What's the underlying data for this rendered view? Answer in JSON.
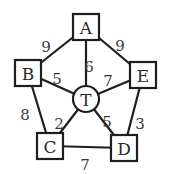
{
  "diagram": {
    "type": "weighted-graph",
    "nodes": [
      {
        "id": "A",
        "label": "A",
        "shape": "square",
        "cx": 86,
        "cy": 27
      },
      {
        "id": "B",
        "label": "B",
        "shape": "square",
        "cx": 28,
        "cy": 73
      },
      {
        "id": "E",
        "label": "E",
        "shape": "square",
        "cx": 143,
        "cy": 75
      },
      {
        "id": "C",
        "label": "C",
        "shape": "square",
        "cx": 50,
        "cy": 146
      },
      {
        "id": "D",
        "label": "D",
        "shape": "square",
        "cx": 124,
        "cy": 148
      },
      {
        "id": "T",
        "label": "T",
        "shape": "circle",
        "cx": 86,
        "cy": 99
      }
    ],
    "edges": [
      {
        "from": "A",
        "to": "B",
        "weight": "9",
        "lx": 46,
        "ly": 47
      },
      {
        "from": "A",
        "to": "E",
        "weight": "9",
        "lx": 120,
        "ly": 46
      },
      {
        "from": "A",
        "to": "T",
        "weight": "6",
        "lx": 89,
        "ly": 67
      },
      {
        "from": "B",
        "to": "T",
        "weight": "5",
        "lx": 57,
        "ly": 79
      },
      {
        "from": "E",
        "to": "T",
        "weight": "7",
        "lx": 108,
        "ly": 81
      },
      {
        "from": "B",
        "to": "C",
        "weight": "8",
        "lx": 25,
        "ly": 115
      },
      {
        "from": "C",
        "to": "T",
        "weight": "2",
        "lx": 59,
        "ly": 124
      },
      {
        "from": "D",
        "to": "T",
        "weight": "5",
        "lx": 107,
        "ly": 122
      },
      {
        "from": "E",
        "to": "D",
        "weight": "3",
        "lx": 140,
        "ly": 124
      },
      {
        "from": "C",
        "to": "D",
        "weight": "7",
        "lx": 85,
        "ly": 165
      }
    ]
  }
}
